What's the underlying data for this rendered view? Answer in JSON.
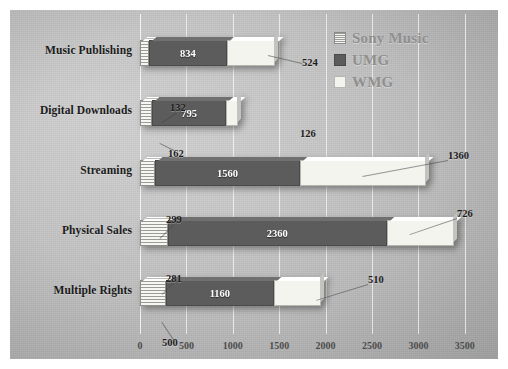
{
  "chart_data": {
    "type": "bar",
    "orientation": "horizontal",
    "stacked": true,
    "title": "",
    "xlabel": "",
    "ylabel": "",
    "xlim": [
      0,
      3750
    ],
    "xticks": [
      0,
      500,
      1000,
      1500,
      2000,
      2500,
      3000,
      3500
    ],
    "xticklabels": [
      "0",
      "500",
      "1000",
      "1500",
      "2000",
      "2500",
      "3000",
      "3500"
    ],
    "grid": true,
    "legend_position": "top-right",
    "categories": [
      "Music Publishing",
      "Digital Downloads",
      "Streaming",
      "Physical Sales",
      "Multiple Rights"
    ],
    "series": [
      {
        "name": "Sony Music",
        "color": "#f2f2ee",
        "pattern": "horizontal-stripes",
        "values": [
          100,
          132,
          162,
          299,
          281
        ]
      },
      {
        "name": "UMG",
        "color": "#5c5c5c",
        "pattern": "solid",
        "values": [
          834,
          795,
          1560,
          2360,
          1160
        ]
      },
      {
        "name": "WMG",
        "color": "#f4f4ef",
        "pattern": "solid",
        "values": [
          524,
          126,
          1360,
          726,
          510
        ]
      }
    ]
  },
  "legend": {
    "items": [
      {
        "label": "Sony Music",
        "key": "sony"
      },
      {
        "label": "UMG",
        "key": "umg"
      },
      {
        "label": "WMG",
        "key": "wmg"
      }
    ]
  },
  "rows": [
    {
      "category": "Music Publishing",
      "segments": [
        {
          "key": "sony",
          "value": 100,
          "label": "",
          "show_label": false
        },
        {
          "key": "umg",
          "value": 834,
          "label": "834",
          "show_label": true
        },
        {
          "key": "wmg",
          "value": 524,
          "label": "",
          "show_label": false
        }
      ],
      "callouts": [
        {
          "text": "524",
          "x": 292,
          "y": 47
        }
      ]
    },
    {
      "category": "Digital Downloads",
      "segments": [
        {
          "key": "sony",
          "value": 132,
          "label": "",
          "show_label": false
        },
        {
          "key": "umg",
          "value": 795,
          "label": "795",
          "show_label": true
        },
        {
          "key": "wmg",
          "value": 126,
          "label": "",
          "show_label": false
        }
      ],
      "callouts": [
        {
          "text": "132",
          "x": 160,
          "y": 92
        },
        {
          "text": "162",
          "x": 158,
          "y": 138
        },
        {
          "text": "126",
          "x": 290,
          "y": 118
        }
      ]
    },
    {
      "category": "Streaming",
      "segments": [
        {
          "key": "sony",
          "value": 162,
          "label": "",
          "show_label": false
        },
        {
          "key": "umg",
          "value": 1560,
          "label": "1560",
          "show_label": true
        },
        {
          "key": "wmg",
          "value": 1360,
          "label": "",
          "show_label": false
        }
      ],
      "callouts": [
        {
          "text": "1360",
          "x": 438,
          "y": 140
        }
      ]
    },
    {
      "category": "Physical Sales",
      "segments": [
        {
          "key": "sony",
          "value": 299,
          "label": "",
          "show_label": false
        },
        {
          "key": "umg",
          "value": 2360,
          "label": "2360",
          "show_label": true
        },
        {
          "key": "wmg",
          "value": 726,
          "label": "",
          "show_label": false
        }
      ],
      "callouts": [
        {
          "text": "299",
          "x": 156,
          "y": 204
        },
        {
          "text": "726",
          "x": 447,
          "y": 198
        }
      ]
    },
    {
      "category": "Multiple Rights",
      "segments": [
        {
          "key": "sony",
          "value": 281,
          "label": "",
          "show_label": false
        },
        {
          "key": "umg",
          "value": 1160,
          "label": "1160",
          "show_label": true
        },
        {
          "key": "wmg",
          "value": 510,
          "label": "",
          "show_label": false
        }
      ],
      "callouts": [
        {
          "text": "281",
          "x": 156,
          "y": 263
        },
        {
          "text": "510",
          "x": 358,
          "y": 264
        },
        {
          "text": "500",
          "x": 152,
          "y": 327
        }
      ]
    }
  ],
  "axis": {
    "ticks": [
      "0",
      "500",
      "1000",
      "1500",
      "2000",
      "2500",
      "3000",
      "3500"
    ]
  },
  "colors": {
    "background": "#bebebe",
    "sony": "#f2f2ee",
    "umg": "#5c5c5c",
    "wmg": "#f4f4ef",
    "gridline": "#fafafa",
    "text": "#1b1b1b",
    "legend_text": "#8f8f8f"
  }
}
